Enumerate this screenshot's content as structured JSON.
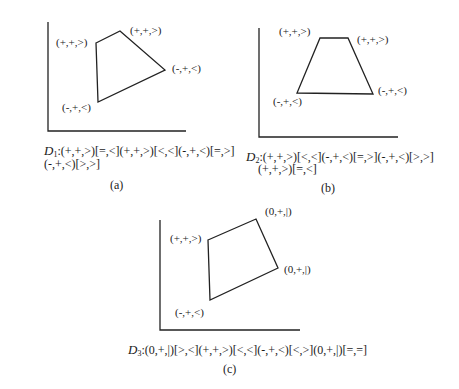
{
  "panels": [
    {
      "id": "a",
      "caption": "(a)",
      "descriptor_prefix": "D",
      "descriptor_sub": "1",
      "descriptor_line1": ":(+,+,>)[=,<](+,+,>)[<,<](-,+,<)[=,>]",
      "descriptor_line2": "(-,+,<)[>,>]",
      "vertex_labels": [
        "(+,+,>)",
        "(+,+,>)",
        "(-,+,<)",
        "(-,+,<)"
      ]
    },
    {
      "id": "b",
      "caption": "(b)",
      "descriptor_prefix": "D",
      "descriptor_sub": "2",
      "descriptor_line1": ":(+,+,>)[<,<](-,+,<)[=,>](-,+,<)[>,>]",
      "descriptor_line2": "(+,+,>)[=,<]",
      "vertex_labels": [
        "(+,+,>)",
        "(+,+,>)",
        "(-,+,<)",
        "(-,+,<)"
      ]
    },
    {
      "id": "c",
      "caption": "(c)",
      "descriptor_prefix": "D",
      "descriptor_sub": "3",
      "descriptor_line1": ":(0,+,|)[>,<](+,+,>)[<,<](-,+,<)[<,>](0,+,|)[=,=]",
      "descriptor_line2": "",
      "vertex_labels": [
        "(+,+,>)",
        "(0,+,|)",
        "(0,+,|)",
        "(-,+,<)"
      ]
    }
  ]
}
